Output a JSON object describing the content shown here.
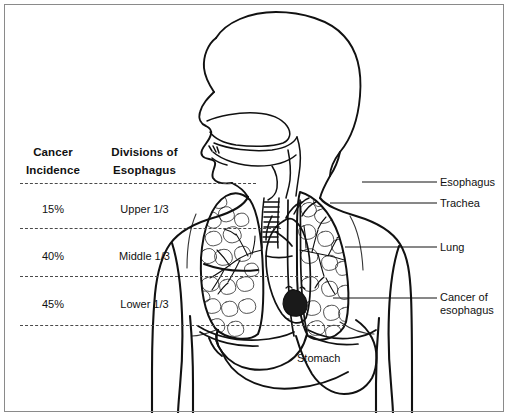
{
  "figure": {
    "background_color": "#ffffff",
    "line_color": "#111111",
    "frame_color": "#8a8a8a"
  },
  "table": {
    "headers": {
      "incidence": "Cancer\nIncidence",
      "divisions": "Divisions of\nEsophagus"
    },
    "rows": [
      {
        "incidence": "15%",
        "division": "Upper 1/3"
      },
      {
        "incidence": "40%",
        "division": "Middle 1/3"
      },
      {
        "incidence": "45%",
        "division": "Lower 1/3"
      }
    ]
  },
  "division_lines": [
    {
      "name": "top-boundary",
      "y": 183,
      "x_start": 20,
      "x_end": 256
    },
    {
      "name": "upper-middle-boundary",
      "y": 228,
      "x_start": 20,
      "x_end": 281
    },
    {
      "name": "middle-lower-boundary",
      "y": 276,
      "x_start": 20,
      "x_end": 318
    },
    {
      "name": "bottom-boundary",
      "y": 325,
      "x_start": 20,
      "x_end": 345
    }
  ],
  "callouts": [
    {
      "name": "esophagus",
      "label": "Esophagus",
      "y": 176,
      "leader_x_start": 362,
      "leader_x_end": 437
    },
    {
      "name": "trachea",
      "label": "Trachea",
      "y": 197,
      "leader_x_start": 330,
      "leader_x_end": 437
    },
    {
      "name": "lung",
      "label": "Lung",
      "y": 242,
      "leader_x_start": 345,
      "leader_x_end": 437
    },
    {
      "name": "cancer-of-esophagus",
      "label": "Cancer of\nesophagus",
      "y": 292,
      "leader_x_start": 333,
      "leader_x_end": 437
    }
  ],
  "organ_labels": [
    {
      "name": "stomach",
      "label": "Stomach"
    }
  ]
}
